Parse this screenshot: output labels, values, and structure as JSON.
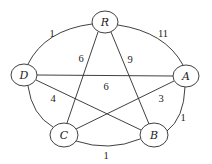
{
  "graph": {
    "nodes": [
      {
        "id": "R",
        "label": "R",
        "cx": 105,
        "cy": 22,
        "rx": 13,
        "ry": 11
      },
      {
        "id": "D",
        "label": "D",
        "cx": 24,
        "cy": 75,
        "rx": 13,
        "ry": 11
      },
      {
        "id": "A",
        "label": "A",
        "cx": 186,
        "cy": 76,
        "rx": 13,
        "ry": 11
      },
      {
        "id": "C",
        "label": "C",
        "cx": 64,
        "cy": 135,
        "rx": 14,
        "ry": 12
      },
      {
        "id": "B",
        "label": "B",
        "cx": 154,
        "cy": 135,
        "rx": 14,
        "ry": 12
      }
    ],
    "edges": [
      {
        "from": "R",
        "to": "D",
        "weight": "1",
        "curved": true
      },
      {
        "from": "R",
        "to": "A",
        "weight": "11",
        "curved": true
      },
      {
        "from": "R",
        "to": "C",
        "weight": "6",
        "curved": false
      },
      {
        "from": "R",
        "to": "B",
        "weight": "9",
        "curved": false
      },
      {
        "from": "D",
        "to": "A",
        "weight": "6",
        "curved": false
      },
      {
        "from": "D",
        "to": "B",
        "weight": "4",
        "curved": false
      },
      {
        "from": "A",
        "to": "C",
        "weight": "3",
        "curved": false
      },
      {
        "from": "A",
        "to": "B",
        "weight": "1",
        "curved": true
      },
      {
        "from": "C",
        "to": "B",
        "weight": "1",
        "curved": true
      },
      {
        "from": "D",
        "to": "C",
        "weight": "",
        "curved": true
      }
    ],
    "weight_labels": [
      {
        "text": "1",
        "x": 52,
        "y": 33
      },
      {
        "text": "11",
        "x": 163,
        "y": 33
      },
      {
        "text": "6",
        "x": 81,
        "y": 58
      },
      {
        "text": "9",
        "x": 130,
        "y": 59
      },
      {
        "text": "6",
        "x": 106,
        "y": 86
      },
      {
        "text": "4",
        "x": 53,
        "y": 98
      },
      {
        "text": "3",
        "x": 161,
        "y": 98
      },
      {
        "text": "1",
        "x": 183,
        "y": 117
      },
      {
        "text": "1",
        "x": 106,
        "y": 155
      }
    ]
  }
}
